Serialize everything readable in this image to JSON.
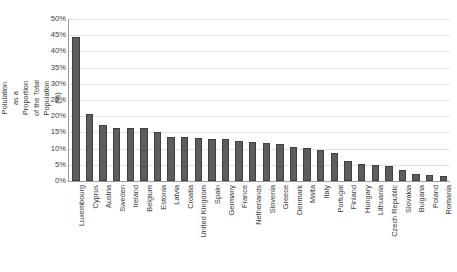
{
  "chart_data": {
    "type": "bar",
    "title": "",
    "xlabel": "",
    "ylabel": "Foreign-Born Polulation as a Proportion of the Total Population (%)",
    "ylim": [
      0,
      50
    ],
    "ytick_labels": [
      "50%",
      "45%",
      "40%",
      "35%",
      "30%",
      "25%",
      "20%",
      "15%",
      "10%",
      "5%",
      "0%"
    ],
    "ytick_values": [
      50,
      45,
      40,
      35,
      30,
      25,
      20,
      15,
      10,
      5,
      0
    ],
    "grid": "horizontal",
    "legend": "none",
    "bar_color": "#5d5d5d",
    "bar_edge_color": "#3f3f3f",
    "gridline_color": "#e2e2e2",
    "axis_color": "#9a9a9a",
    "categories": [
      "Luxembourg",
      "Cyprus",
      "Austria",
      "Sweden",
      "Ireland",
      "Belgium",
      "Estonia",
      "Latvia",
      "Croatia",
      "United Kingdom",
      "Spain",
      "Germany",
      "France",
      "Netherlands",
      "Slovenia",
      "Greece",
      "Denmark",
      "Malta",
      "Italy",
      "Portugal",
      "Finland",
      "Hungary",
      "Lithuania",
      "Czech Republic",
      "Slovakia",
      "Bulgaria",
      "Poland",
      "Romania"
    ],
    "values": [
      44.5,
      20.8,
      17.2,
      16.5,
      16.4,
      16.3,
      15.1,
      13.7,
      13.5,
      13.2,
      13.0,
      12.9,
      12.3,
      11.9,
      11.6,
      11.3,
      10.5,
      10.3,
      9.7,
      8.8,
      6.1,
      5.2,
      4.8,
      4.6,
      3.5,
      2.1,
      1.9,
      1.5
    ]
  }
}
